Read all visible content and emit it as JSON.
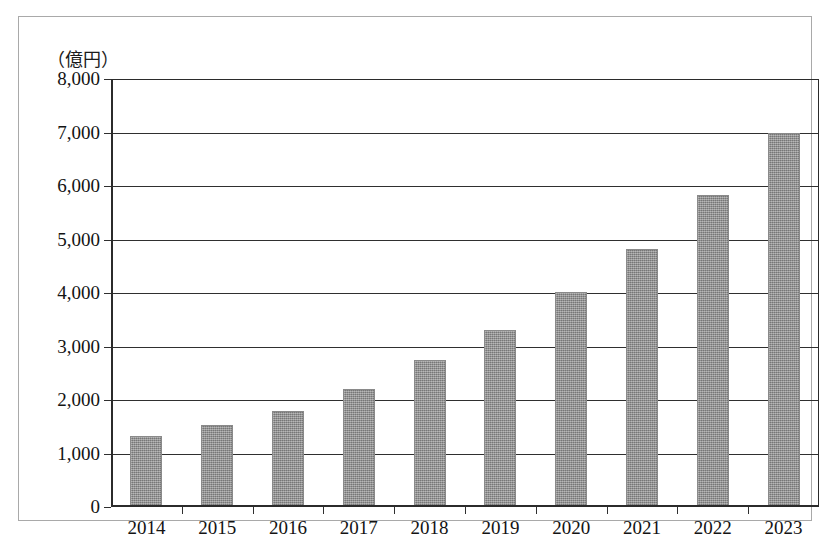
{
  "figure": {
    "y_unit_caption": "（億円）"
  },
  "chart_data": {
    "type": "bar",
    "title": "",
    "xlabel": "",
    "ylabel": "（億円）",
    "categories": [
      "2014",
      "2015",
      "2016",
      "2017",
      "2018",
      "2019",
      "2020",
      "2021",
      "2022",
      "2023"
    ],
    "values": [
      1320,
      1530,
      1800,
      2200,
      2740,
      3300,
      4010,
      4830,
      5830,
      7000
    ],
    "ylim": [
      0,
      8000
    ],
    "ytick_values": [
      0,
      1000,
      2000,
      3000,
      4000,
      5000,
      6000,
      7000,
      8000
    ],
    "ytick_labels": [
      "0",
      "1,000",
      "2,000",
      "3,000",
      "4,000",
      "5,000",
      "6,000",
      "7,000",
      "8,000"
    ],
    "grid": true,
    "legend": null,
    "bar_color": "#8f8f8f",
    "axis_color": "#2f2f2f"
  }
}
